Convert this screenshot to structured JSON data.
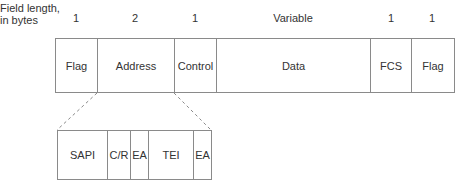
{
  "header": {
    "line1": "Field length,",
    "line2": "in bytes"
  },
  "frame": {
    "fields": [
      {
        "label": "Flag",
        "length": "1"
      },
      {
        "label": "Address",
        "length": "2"
      },
      {
        "label": "Control",
        "length": "1"
      },
      {
        "label": "Data",
        "length": "Variable"
      },
      {
        "label": "FCS",
        "length": "1"
      },
      {
        "label": "Flag",
        "length": "1"
      }
    ]
  },
  "address_detail": {
    "fields": [
      {
        "label": "SAPI"
      },
      {
        "label": "C/R"
      },
      {
        "label": "EA"
      },
      {
        "label": "TEI"
      },
      {
        "label": "EA"
      }
    ]
  },
  "colors": {
    "line": "#8a8a8a",
    "text": "#333333"
  }
}
